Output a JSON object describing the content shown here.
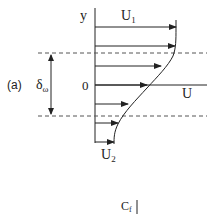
{
  "figure": {
    "panel_label": "(a)",
    "axis_y_label": "y",
    "origin_label": "0",
    "upper_velocity_label": "U",
    "upper_velocity_sub": "1",
    "lower_velocity_label": "U",
    "lower_velocity_sub": "2",
    "x_axis_label": "U",
    "thickness_label": "δ",
    "thickness_sub": "ω",
    "next_panel_label": "C",
    "next_panel_sub": "f"
  },
  "colors": {
    "ink": "#222222",
    "dashed": "#555555",
    "background": "#ffffff"
  }
}
